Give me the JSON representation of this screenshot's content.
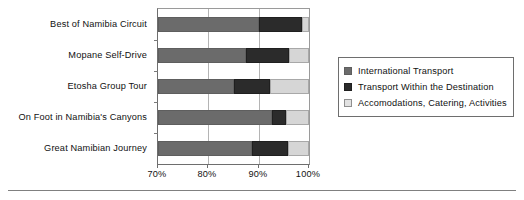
{
  "chart_data": {
    "type": "bar",
    "orientation": "horizontal",
    "stacked": true,
    "title": "",
    "xlabel": "",
    "ylabel": "",
    "xlim": [
      70,
      100
    ],
    "xticks": [
      70,
      80,
      90,
      100
    ],
    "xtick_labels": [
      "70%",
      "80%",
      "90%",
      "100%"
    ],
    "grid": true,
    "grid_axis": "x",
    "legend_position": "right",
    "categories": [
      "Best of Namibia Circuit",
      "Mopane Self-Drive",
      "Etosha Group Tour",
      "On Foot in Namibia's Canyons",
      "Great Namibian Journey"
    ],
    "series": [
      {
        "name": "International Transport",
        "color": "#6b6b6b",
        "values": [
          90.0,
          87.5,
          85.0,
          92.6,
          88.7
        ]
      },
      {
        "name": "Transport Within the Destination",
        "color": "#2b2b2b",
        "values": [
          8.6,
          8.5,
          7.3,
          2.8,
          7.1
        ]
      },
      {
        "name": "Accomodations, Catering, Activities",
        "color": "#d6d6d6",
        "values": [
          1.4,
          4.0,
          7.7,
          4.6,
          4.2
        ]
      }
    ],
    "cumulative_boundaries": [
      [
        90.0,
        98.6
      ],
      [
        87.5,
        96.0
      ],
      [
        85.0,
        92.3
      ],
      [
        92.6,
        95.4
      ],
      [
        88.7,
        95.8
      ]
    ]
  },
  "legend": {
    "items": [
      {
        "label": "International Transport",
        "swatch": "sw-a"
      },
      {
        "label": "Transport Within the Destination",
        "swatch": "sw-b"
      },
      {
        "label": "Accomodations, Catering, Activities",
        "swatch": "sw-c"
      }
    ]
  }
}
